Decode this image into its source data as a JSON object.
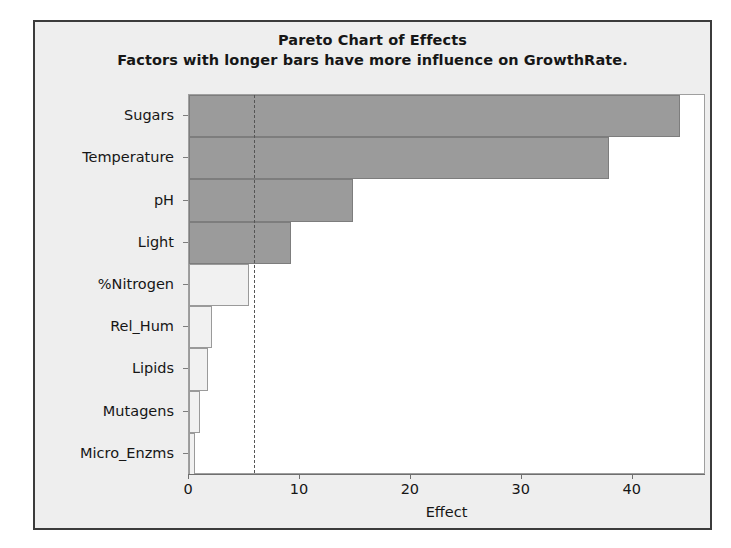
{
  "chart_data": {
    "type": "bar",
    "orientation": "horizontal",
    "title": "Pareto Chart of Effects",
    "subtitle": "Factors with longer bars have more influence on GrowthRate.",
    "xlabel": "Effect",
    "ylabel": "",
    "xlim": [
      0,
      46.6
    ],
    "xticks": [
      0,
      10,
      20,
      30,
      40
    ],
    "xtick_labels": [
      "0",
      "10",
      "20",
      "30",
      "40"
    ],
    "grid": false,
    "legend": "none",
    "reference_line": {
      "value": 5.85,
      "style": "dashed",
      "color": "#555555",
      "label": ""
    },
    "categories": [
      "Sugars",
      "Temperature",
      "pH",
      "Light",
      "%Nitrogen",
      "Rel_Hum",
      "Lipids",
      "Mutagens",
      "Micro_Enzms"
    ],
    "values": [
      44.3,
      37.9,
      14.8,
      9.2,
      5.4,
      2.1,
      1.7,
      1.0,
      0.5
    ],
    "bar_significance": [
      "significant",
      "significant",
      "significant",
      "significant",
      "nonsignificant",
      "nonsignificant",
      "nonsignificant",
      "nonsignificant",
      "nonsignificant"
    ],
    "colors": {
      "significant_fill": "#9b9b9b",
      "nonsignificant_fill": "#f1f1f1",
      "bar_outline": "#8e8e8e",
      "panel_background": "#eeeeee",
      "plot_background": "#ffffff",
      "frame_border": "#3b3b3b",
      "text": "#161616"
    }
  }
}
